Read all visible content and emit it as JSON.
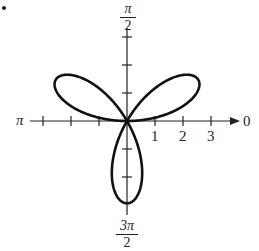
{
  "chart_data": {
    "type": "line",
    "subtype": "polar",
    "equation_form": "r = 3 sin(3θ)",
    "curve": "three-petal rose",
    "petal_count": 3,
    "petal_length": 3,
    "petal_directions": [
      "π/6",
      "5π/6",
      "3π/2"
    ],
    "axis_labels": {
      "zero": "0",
      "pi_over_2_num": "π",
      "pi_over_2_den": "2",
      "pi": "π",
      "three_pi_over_2_num": "3π",
      "three_pi_over_2_den": "2"
    },
    "radial_ticks": [
      "1",
      "2",
      "3"
    ],
    "rlim": [
      0,
      3
    ],
    "grid": false,
    "legend": null,
    "line_color": "#111111"
  }
}
